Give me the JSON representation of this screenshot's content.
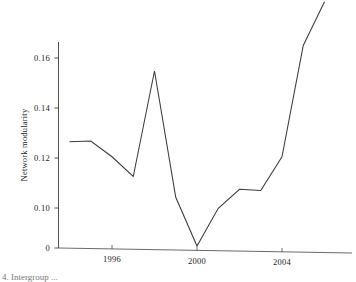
{
  "chart_data": {
    "type": "line",
    "title": "",
    "xlabel": "",
    "ylabel": "Network modularity",
    "xlim": [
      1993.55,
      2006.25
    ],
    "ylim_display": [
      0,
      0.1836
    ],
    "axis_break": true,
    "xticks": [
      1996,
      2000,
      2004
    ],
    "xtick_labels": [
      "1996",
      "2000",
      "2004"
    ],
    "yticks": [
      0,
      0.1,
      0.12,
      0.14,
      0.16
    ],
    "ytick_labels": [
      "0",
      "0.10",
      "0.12",
      "0.14",
      "0.16"
    ],
    "grid": false,
    "legend": false,
    "line_color": "#3b3b3b",
    "series": [
      {
        "name": "Network modularity",
        "x": [
          1994,
          1995,
          1996,
          1997,
          1998,
          1999,
          2000,
          2001,
          2002,
          2003,
          2004,
          2005,
          2006
        ],
        "y": [
          0.1265,
          0.1268,
          0.1205,
          0.1126,
          0.1548,
          0.1043,
          0.0048,
          0.0992,
          0.1075,
          0.107,
          0.1205,
          0.165,
          0.1825
        ]
      }
    ]
  },
  "ylabel_text": "Network modularity",
  "caption": "4. Intergroup ...",
  "ytick_labels": {
    "t0": "0",
    "t1": "0.10",
    "t2": "0.12",
    "t3": "0.14",
    "t4": "0.16"
  },
  "xtick_labels": {
    "t0": "1996",
    "t1": "2000",
    "t2": "2004"
  }
}
